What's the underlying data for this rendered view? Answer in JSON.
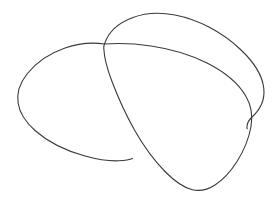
{
  "canvas": {
    "width": 278,
    "height": 205,
    "background_color": "#ffffff",
    "title": "Line drawing of three overlapping oval shapes"
  },
  "style": {
    "stroke_color": "#3a3a3a",
    "stroke_color_soft": "#4a4a4a",
    "stroke_width": 1.1,
    "fill": "none"
  },
  "drawing": {
    "subject": "three-overlapping-ovals",
    "medium": "pen-line-sketch",
    "shape_count": 3,
    "shapes": [
      {
        "id": "back-oval",
        "name": "back-right-oval",
        "description": "Large open arc behind the others, peaks near the top and tails down on the right",
        "z_order": 1,
        "closed": false,
        "stroke_color": "#3a3a3a",
        "stroke_width": 1.1,
        "bounds": {
          "x": 104,
          "y": 12,
          "width": 160,
          "height": 118
        },
        "path": "M 104.5 44.0 C 108 33 118 23 133 17.5 C 146 12.6 160 12.2 175 15.0 C 198 19.4 222 32.0 240 49.0 C 254 62.0 262.5 76.0 263.8 88.5 C 265.0 100.5 259.5 110.5 251.5 117.5 C 249.0 119.8 247.5 122.5 247.0 126.0 C 246.8 127.2 246.9 128.0 247.2 128.8"
      },
      {
        "id": "left-oval",
        "name": "left-oval",
        "description": "Closed rounded oval on the left, widest near the middle height",
        "z_order": 2,
        "closed": true,
        "stroke_color": "#3a3a3a",
        "stroke_width": 1.1,
        "bounds": {
          "x": 17,
          "y": 42,
          "width": 150,
          "height": 122
        },
        "path": "M 104.5 44.0 C 92 42.2 78 43.5 65 48.0 C 50 53.2 36 62.5 27 74.0 C 19.5 83.5 16.6 94.0 18.2 103.5 C 19.8 113.5 26.0 122.5 35.0 130.5 C 48.0 142.0 66.0 150.8 85.0 156.0 C 98.0 159.6 110.0 161.2 119.0 160.8 C 125.5 160.5 130.0 159.6 132.5 158.5"
      },
      {
        "id": "front-oval",
        "name": "front-oval",
        "description": "Foreground oval overlapping the other two, tilted with its long axis running lower-right",
        "z_order": 3,
        "closed": true,
        "stroke_color": "#3a3a3a",
        "stroke_width": 1.1,
        "bounds": {
          "x": 99,
          "y": 43,
          "width": 153,
          "height": 148
        },
        "path": "M 104.5 44.0 C 119 43.0 135 43.6 151 46.0 C 170 48.8 190 54.5 207 63.0 C 224 71.6 238 83.0 245.5 95.5 C 251.5 105.5 253.0 115.5 251.0 126.5 C 249.0 138.0 244.0 150.5 237.0 161.5 C 231.0 171.0 223.5 179.5 215.0 185.0 C 207.0 190.2 199.0 191.5 191.5 189.5 C 183.0 187.2 174.5 181.0 166.0 172.5 C 154.5 161.0 143.5 146.0 134.5 130.0 C 125.0 113.2 117.5 96.0 112.0 81.5 C 107.0 68.5 104.2 57.0 103.8 48.5 C 103.7 46.3 104.0 44.9 104.5 44.0"
      }
    ]
  }
}
